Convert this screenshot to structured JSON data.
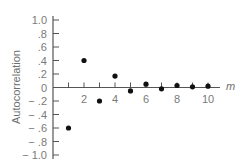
{
  "chart_data": {
    "type": "scatter",
    "title": "",
    "xlabel": "m",
    "ylabel": "Autocorrelation",
    "x": [
      1,
      2,
      3,
      4,
      5,
      6,
      7,
      8,
      9,
      10
    ],
    "y": [
      -0.6,
      0.4,
      -0.2,
      0.17,
      -0.05,
      0.05,
      -0.02,
      0.03,
      0.01,
      0.02
    ],
    "xlim": [
      0,
      10.6
    ],
    "ylim": [
      -1.0,
      1.0
    ],
    "x_ticks": [
      1,
      2,
      3,
      4,
      5,
      6,
      7,
      8,
      9,
      10
    ],
    "x_tick_labels": [
      {
        "value": 2,
        "label": "2"
      },
      {
        "value": 4,
        "label": "4"
      },
      {
        "value": 6,
        "label": "6"
      },
      {
        "value": 8,
        "label": "8"
      },
      {
        "value": 10,
        "label": "10"
      }
    ],
    "y_ticks": [
      {
        "value": 1.0,
        "label": "1.0"
      },
      {
        "value": 0.8,
        "label": ".8"
      },
      {
        "value": 0.6,
        "label": ".6"
      },
      {
        "value": 0.4,
        "label": ".4"
      },
      {
        "value": 0.2,
        "label": ".2"
      },
      {
        "value": 0.0,
        "label": "0"
      },
      {
        "value": -0.2,
        "label": "− .2"
      },
      {
        "value": -0.4,
        "label": "− .4"
      },
      {
        "value": -0.6,
        "label": "− .6"
      },
      {
        "value": -0.8,
        "label": "− .8"
      },
      {
        "value": -1.0,
        "label": "− 1.0"
      }
    ],
    "grid": false,
    "legend": "none",
    "colors": {
      "axis": "#555555",
      "point": "#111111",
      "text": "#7a7a7a"
    }
  }
}
